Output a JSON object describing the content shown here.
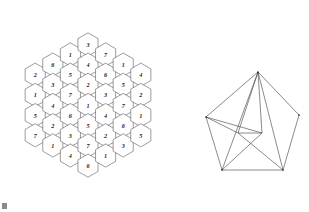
{
  "figure": {
    "background_color": "#ffffff",
    "line_color": "#3d3d3d",
    "hex_stroke_color": "#4a4a4a",
    "digit_color": "#1c1c1c"
  },
  "hex_grid": {
    "name": "honeycomb-number-grid",
    "shape": "hexagonal",
    "total_cells": 37,
    "column_counts": [
      4,
      5,
      6,
      7,
      6,
      5,
      4
    ],
    "digit_range": "1-7",
    "geometry": {
      "center_x": 88,
      "center_y": 105,
      "cell_radius": 11.6,
      "column_step": 17.6,
      "row_step": 20.2
    },
    "columns": [
      {
        "index": 0,
        "count": 4,
        "values": [
          2,
          1,
          5,
          7
        ]
      },
      {
        "index": 1,
        "count": 5,
        "values": [
          6,
          3,
          4,
          2,
          1
        ]
      },
      {
        "index": 2,
        "count": 6,
        "values": [
          1,
          5,
          7,
          6,
          3,
          4
        ]
      },
      {
        "index": 3,
        "count": 7,
        "values": [
          3,
          4,
          2,
          1,
          5,
          7,
          6
        ]
      },
      {
        "index": 4,
        "count": 6,
        "values": [
          7,
          6,
          3,
          4,
          2,
          1
        ]
      },
      {
        "index": 5,
        "count": 5,
        "values": [
          1,
          5,
          7,
          6,
          3
        ]
      },
      {
        "index": 6,
        "count": 4,
        "values": [
          4,
          2,
          1,
          5
        ]
      }
    ]
  },
  "pentagon_figure": {
    "name": "pentagon-with-internal-diagonals",
    "vertex_count": 5,
    "vertices": [
      {
        "id": "apex",
        "x": 258,
        "y": 72
      },
      {
        "id": "upper-right",
        "x": 299,
        "y": 115
      },
      {
        "id": "lower-right",
        "x": 283,
        "y": 170
      },
      {
        "id": "lower-left",
        "x": 222,
        "y": 170
      },
      {
        "id": "upper-left",
        "x": 206,
        "y": 117
      }
    ],
    "inner_points": [
      {
        "id": "inner-left",
        "x": 238,
        "y": 133
      },
      {
        "id": "inner-right",
        "x": 262,
        "y": 133
      },
      {
        "id": "crossing",
        "x": 250,
        "y": 146
      }
    ],
    "outline": [
      "apex",
      "upper-right",
      "lower-right",
      "lower-left",
      "upper-left"
    ],
    "chords": [
      {
        "from": "apex",
        "to": "inner-left"
      },
      {
        "from": "apex",
        "to": "inner-right"
      },
      {
        "from": "upper-left",
        "to": "inner-left"
      },
      {
        "from": "upper-left",
        "to": "inner-right"
      },
      {
        "from": "inner-left",
        "to": "inner-right"
      },
      {
        "from": "inner-left",
        "to": "lower-right"
      },
      {
        "from": "inner-right",
        "to": "lower-left"
      },
      {
        "from": "apex",
        "to": "lower-left"
      },
      {
        "from": "apex",
        "to": "lower-right"
      }
    ]
  },
  "corner_mark": {
    "name": "page-corner-mark",
    "x": 2,
    "y": 203,
    "width": 5,
    "height": 6
  }
}
